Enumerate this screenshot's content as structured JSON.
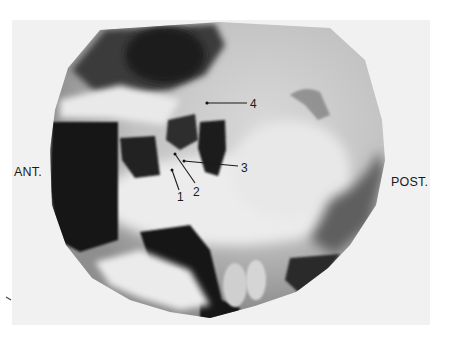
{
  "figure": {
    "type": "lateral radiograph",
    "orientation": {
      "left": "ANT.",
      "right": "POST."
    },
    "callouts": [
      {
        "id": "1",
        "label": "1"
      },
      {
        "id": "2",
        "label": "2"
      },
      {
        "id": "3",
        "label": "3"
      },
      {
        "id": "4",
        "label": "4"
      }
    ],
    "colors": {
      "page": "#ffffff",
      "mount": "#f1f1f1",
      "film_light": "#e6e6e6",
      "film_mid": "#8a8a8a",
      "film_dark": "#161616",
      "ink": "#1a1a1a"
    }
  }
}
